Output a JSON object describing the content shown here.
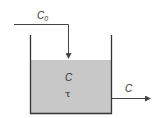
{
  "diagram": {
    "type": "CSTR tank schematic",
    "inlet": {
      "label": "C",
      "subscript": "0"
    },
    "tank": {
      "concentration_label": "C",
      "residence_time_label": "τ"
    },
    "outlet": {
      "label": "C"
    },
    "colors": {
      "liquid": "#c8c8c8",
      "lines": "#333333",
      "background": "#ffffff"
    }
  }
}
